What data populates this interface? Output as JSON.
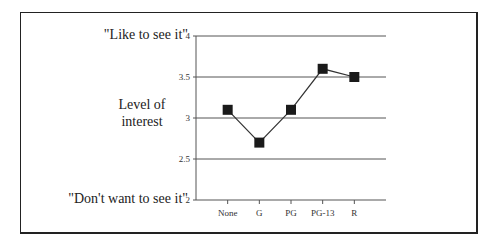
{
  "chart_data": {
    "type": "line",
    "title": "",
    "xlabel": "",
    "ylabel": "Level of interest",
    "categories": [
      "None",
      "G",
      "PG",
      "PG-13",
      "R"
    ],
    "series": [
      {
        "name": "Level of interest",
        "values": [
          3.1,
          2.7,
          3.1,
          3.6,
          3.5
        ]
      }
    ],
    "ylim": [
      2,
      4
    ],
    "yticks": [
      "2",
      "2.5",
      "3",
      "3.5",
      "4"
    ],
    "grid": true,
    "legend": null,
    "annotations": {
      "top": "\"Like to see it\"",
      "bottom": "\"Don't want to see it\""
    }
  },
  "labels": {
    "like": "\"Like to see it\"",
    "dont": "\"Don't want to see it\"",
    "level_line1": "Level of",
    "level_line2": "interest"
  },
  "colors": {
    "line": "#333333",
    "marker": "#1a1a1a",
    "grid": "#555555"
  }
}
